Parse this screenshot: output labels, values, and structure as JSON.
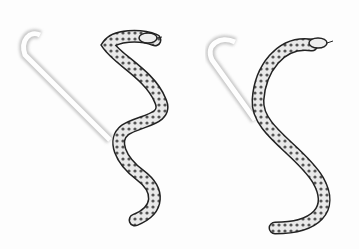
{
  "image": {
    "subject": "Stippled illustration of two snakes demonstrating sidewinding locomotion with ghosted body tracks",
    "background_color": "#fdfdfd",
    "ink_color": "#1a1a1a",
    "figures": [
      {
        "name": "left-snake",
        "pose": "S-curve with head raised to the right, ghost trail diagonal to upper-left"
      },
      {
        "name": "right-snake",
        "pose": "large S-curve with head raised to upper-right, ghost trail diagonal to upper-left"
      }
    ]
  }
}
